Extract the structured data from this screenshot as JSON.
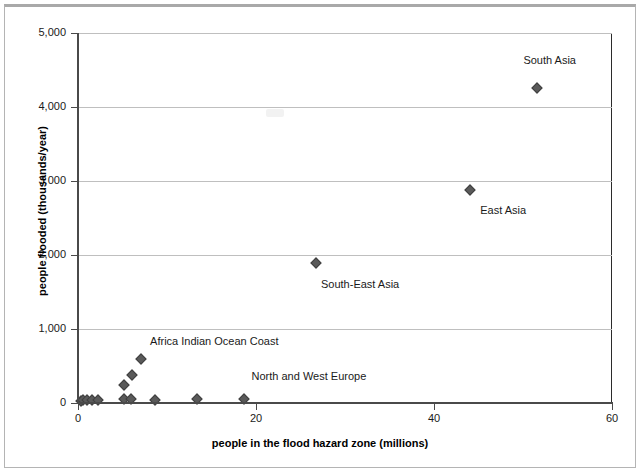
{
  "chart_data": {
    "type": "scatter",
    "title": "",
    "xlabel": "people in the flood hazard zone (millions)",
    "ylabel": "people flooded (thousands/year)",
    "xlim": [
      0,
      60
    ],
    "ylim": [
      0,
      5000
    ],
    "xticks": [
      "0",
      "20",
      "40",
      "60"
    ],
    "xtick_values": [
      0,
      20,
      40,
      60
    ],
    "yticks": [
      "0",
      "1,000",
      "2,000",
      "3,000",
      "4,000",
      "5,000"
    ],
    "ytick_values": [
      0,
      1000,
      2000,
      3000,
      4000,
      5000
    ],
    "grid": "horizontal",
    "legend": "none",
    "marker_color": "#5a5a5a",
    "marker_shape": "diamond",
    "points": [
      {
        "x": 0.3,
        "y": 30,
        "label": ""
      },
      {
        "x": 0.6,
        "y": 40,
        "label": ""
      },
      {
        "x": 1.0,
        "y": 35,
        "label": ""
      },
      {
        "x": 1.6,
        "y": 45,
        "label": ""
      },
      {
        "x": 2.3,
        "y": 40,
        "label": ""
      },
      {
        "x": 5.2,
        "y": 50,
        "label": ""
      },
      {
        "x": 5.9,
        "y": 60,
        "label": ""
      },
      {
        "x": 5.2,
        "y": 250,
        "label": ""
      },
      {
        "x": 6.1,
        "y": 380,
        "label": ""
      },
      {
        "x": 7.1,
        "y": 600,
        "label": "Africa Indian Ocean Coast"
      },
      {
        "x": 8.6,
        "y": 45,
        "label": ""
      },
      {
        "x": 13.4,
        "y": 50,
        "label": ""
      },
      {
        "x": 18.6,
        "y": 55,
        "label": "North and West Europe"
      },
      {
        "x": 26.7,
        "y": 1890,
        "label": "South-East Asia"
      },
      {
        "x": 44.0,
        "y": 2880,
        "label": "East Asia"
      },
      {
        "x": 51.6,
        "y": 4260,
        "label": "South Asia"
      }
    ],
    "annotations": [
      {
        "text": "South Asia",
        "x": 53.0,
        "y": 4620,
        "anchor": "center"
      },
      {
        "text": "East Asia",
        "x": 45.2,
        "y": 2590,
        "anchor": "left"
      },
      {
        "text": "South-East Asia",
        "x": 27.3,
        "y": 1600,
        "anchor": "left"
      },
      {
        "text": "Africa Indian Ocean Coast",
        "x": 8.1,
        "y": 820,
        "anchor": "left"
      },
      {
        "text": "North and West Europe",
        "x": 19.5,
        "y": 350,
        "anchor": "left"
      }
    ]
  }
}
